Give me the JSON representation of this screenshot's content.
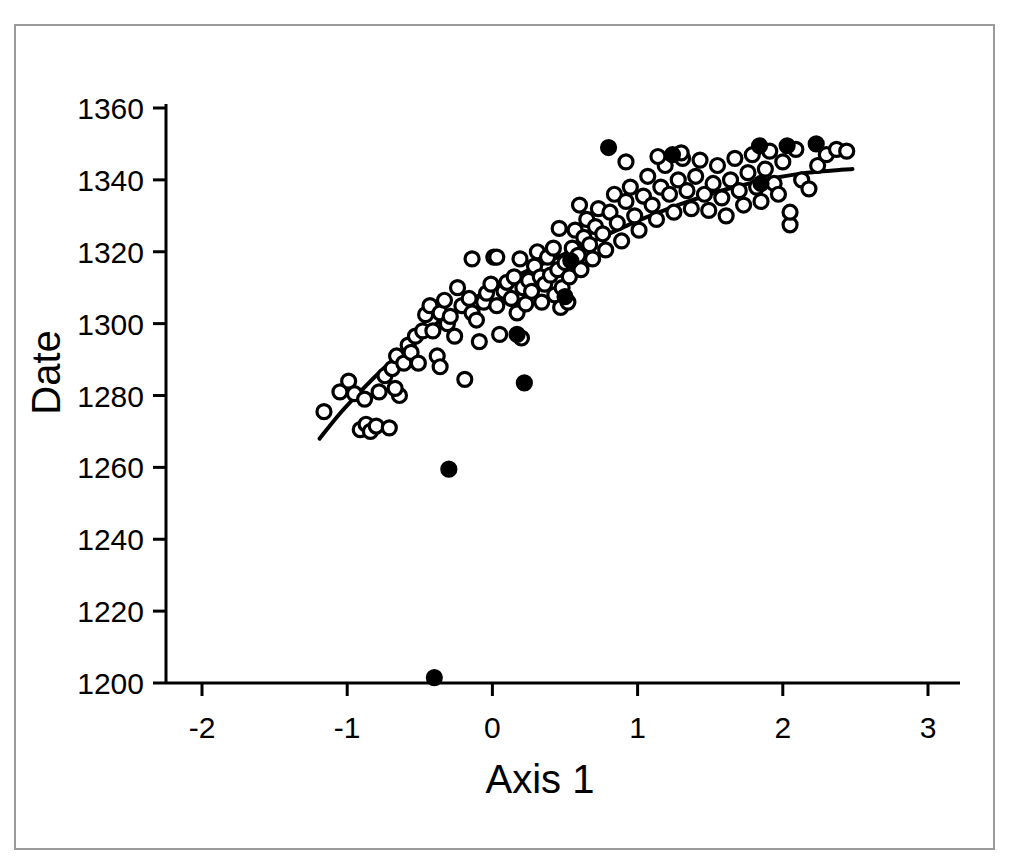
{
  "figure": {
    "background": "#ffffff",
    "frame_color": "#9a9a9a",
    "ink_color": "#000000"
  },
  "labels": {
    "xlabel": "Axis 1",
    "ylabel": "Date"
  },
  "chart_data": {
    "type": "scatter",
    "title": "",
    "xlabel": "Axis 1",
    "ylabel": "Date",
    "xlim": [
      -2.45,
      3.45
    ],
    "ylim": [
      1193,
      1367
    ],
    "xticks": [
      -2,
      -1,
      0,
      1,
      2,
      3
    ],
    "xticklabels": [
      "-2",
      "-1",
      "0",
      "1",
      "2",
      "3"
    ],
    "yticks": [
      1200,
      1220,
      1240,
      1260,
      1280,
      1300,
      1320,
      1340,
      1360
    ],
    "yticklabels": [
      "1200",
      "1220",
      "1240",
      "1260",
      "1280",
      "1300",
      "1320",
      "1340",
      "1360"
    ],
    "grid": false,
    "legend": false,
    "marker_radius_px": 7,
    "series": [
      {
        "name": "open-circles",
        "marker": "open circle",
        "fill": "none",
        "edge": "#000000",
        "points": [
          [
            -1.16,
            1275.5
          ],
          [
            -1.05,
            1281.0
          ],
          [
            -0.99,
            1284.0
          ],
          [
            -0.95,
            1280.5
          ],
          [
            -0.91,
            1270.5
          ],
          [
            -0.87,
            1272.0
          ],
          [
            -0.84,
            1270.0
          ],
          [
            -0.8,
            1271.5
          ],
          [
            -0.78,
            1281.0
          ],
          [
            -0.74,
            1285.5
          ],
          [
            -0.71,
            1271.0
          ],
          [
            -0.69,
            1287.5
          ],
          [
            -0.66,
            1291.0
          ],
          [
            -0.64,
            1280.0
          ],
          [
            -0.61,
            1289.0
          ],
          [
            -0.58,
            1294.0
          ],
          [
            -0.56,
            1292.0
          ],
          [
            -0.53,
            1296.5
          ],
          [
            -0.51,
            1289.0
          ],
          [
            -0.48,
            1298.0
          ],
          [
            -0.46,
            1302.5
          ],
          [
            -0.43,
            1305.0
          ],
          [
            -0.41,
            1298.0
          ],
          [
            -0.38,
            1291.0
          ],
          [
            -0.36,
            1303.0
          ],
          [
            -0.33,
            1306.5
          ],
          [
            -0.31,
            1300.0
          ],
          [
            -0.29,
            1302.0
          ],
          [
            -0.26,
            1296.5
          ],
          [
            -0.24,
            1310.0
          ],
          [
            -0.21,
            1305.0
          ],
          [
            -0.19,
            1284.5
          ],
          [
            -0.16,
            1307.0
          ],
          [
            -0.14,
            1303.0
          ],
          [
            -0.11,
            1301.0
          ],
          [
            -0.09,
            1295.0
          ],
          [
            -0.06,
            1306.0
          ],
          [
            -0.04,
            1308.5
          ],
          [
            -0.01,
            1311.0
          ],
          [
            0.01,
            1318.5
          ],
          [
            0.03,
            1305.0
          ],
          [
            0.05,
            1297.0
          ],
          [
            0.08,
            1309.0
          ],
          [
            0.1,
            1311.5
          ],
          [
            0.13,
            1307.0
          ],
          [
            0.15,
            1313.0
          ],
          [
            0.17,
            1303.0
          ],
          [
            0.19,
            1318.0
          ],
          [
            0.21,
            1310.0
          ],
          [
            0.23,
            1305.5
          ],
          [
            0.25,
            1312.0
          ],
          [
            0.27,
            1309.0
          ],
          [
            0.29,
            1316.0
          ],
          [
            0.31,
            1320.0
          ],
          [
            0.33,
            1313.0
          ],
          [
            0.34,
            1306.0
          ],
          [
            0.36,
            1311.0
          ],
          [
            0.38,
            1318.5
          ],
          [
            0.4,
            1313.5
          ],
          [
            0.42,
            1321.0
          ],
          [
            0.43,
            1308.0
          ],
          [
            0.45,
            1315.0
          ],
          [
            0.47,
            1304.5
          ],
          [
            0.48,
            1310.0
          ],
          [
            0.5,
            1317.0
          ],
          [
            0.52,
            1306.0
          ],
          [
            0.53,
            1313.0
          ],
          [
            0.55,
            1321.0
          ],
          [
            0.57,
            1326.0
          ],
          [
            0.59,
            1319.0
          ],
          [
            0.61,
            1315.0
          ],
          [
            0.63,
            1324.0
          ],
          [
            0.65,
            1329.0
          ],
          [
            0.67,
            1322.0
          ],
          [
            0.69,
            1318.0
          ],
          [
            0.71,
            1327.0
          ],
          [
            0.73,
            1332.0
          ],
          [
            0.76,
            1325.0
          ],
          [
            0.78,
            1320.5
          ],
          [
            0.81,
            1331.0
          ],
          [
            0.84,
            1336.0
          ],
          [
            0.86,
            1328.0
          ],
          [
            0.89,
            1323.0
          ],
          [
            0.92,
            1334.0
          ],
          [
            0.95,
            1338.0
          ],
          [
            0.98,
            1330.0
          ],
          [
            1.01,
            1326.0
          ],
          [
            1.04,
            1335.5
          ],
          [
            1.07,
            1341.0
          ],
          [
            1.1,
            1333.0
          ],
          [
            1.13,
            1329.0
          ],
          [
            1.16,
            1338.0
          ],
          [
            1.19,
            1344.0
          ],
          [
            1.22,
            1336.0
          ],
          [
            1.25,
            1331.0
          ],
          [
            1.28,
            1340.0
          ],
          [
            1.31,
            1346.0
          ],
          [
            1.34,
            1337.0
          ],
          [
            1.37,
            1332.0
          ],
          [
            1.4,
            1341.0
          ],
          [
            1.43,
            1345.5
          ],
          [
            1.46,
            1336.0
          ],
          [
            1.49,
            1331.5
          ],
          [
            1.52,
            1339.0
          ],
          [
            1.55,
            1344.0
          ],
          [
            1.58,
            1335.0
          ],
          [
            1.61,
            1330.0
          ],
          [
            1.64,
            1340.0
          ],
          [
            1.67,
            1346.0
          ],
          [
            1.7,
            1337.0
          ],
          [
            1.73,
            1333.0
          ],
          [
            1.76,
            1342.0
          ],
          [
            1.79,
            1347.0
          ],
          [
            1.82,
            1338.0
          ],
          [
            1.85,
            1334.0
          ],
          [
            1.88,
            1343.0
          ],
          [
            1.91,
            1348.0
          ],
          [
            1.94,
            1339.0
          ],
          [
            1.97,
            1336.0
          ],
          [
            2.0,
            1345.0
          ],
          [
            2.05,
            1327.5
          ],
          [
            2.05,
            1331.0
          ],
          [
            2.09,
            1348.5
          ],
          [
            2.13,
            1340.0
          ],
          [
            2.18,
            1337.5
          ],
          [
            2.24,
            1344.0
          ],
          [
            2.3,
            1347.0
          ],
          [
            2.37,
            1348.5
          ],
          [
            2.44,
            1348.0
          ],
          [
            0.03,
            1318.5
          ],
          [
            -0.14,
            1318.0
          ],
          [
            1.3,
            1347.5
          ],
          [
            0.92,
            1345.0
          ],
          [
            1.14,
            1346.5
          ],
          [
            0.6,
            1333.0
          ],
          [
            0.46,
            1326.5
          ],
          [
            0.2,
            1296.0
          ],
          [
            -0.36,
            1288.0
          ],
          [
            -0.67,
            1282.0
          ],
          [
            -0.88,
            1279.0
          ]
        ]
      },
      {
        "name": "filled-circles",
        "marker": "filled circle",
        "fill": "#000000",
        "edge": "#000000",
        "points": [
          [
            -0.4,
            1201.5
          ],
          [
            -0.3,
            1259.5
          ],
          [
            0.22,
            1283.5
          ],
          [
            0.17,
            1297.0
          ],
          [
            0.5,
            1307.5
          ],
          [
            0.54,
            1317.5
          ],
          [
            0.8,
            1349.0
          ],
          [
            1.24,
            1347.0
          ],
          [
            1.85,
            1339.0
          ],
          [
            2.03,
            1349.5
          ],
          [
            2.23,
            1350.0
          ],
          [
            1.84,
            1349.5
          ]
        ]
      }
    ],
    "fit_curve": {
      "name": "smoothed-trend-line",
      "description": "monotone saturating trend line through point cloud",
      "color": "#000000",
      "width_px": 4,
      "points": [
        [
          -1.19,
          1268.0
        ],
        [
          -1.05,
          1275.0
        ],
        [
          -0.9,
          1281.5
        ],
        [
          -0.75,
          1287.5
        ],
        [
          -0.6,
          1293.0
        ],
        [
          -0.45,
          1298.0
        ],
        [
          -0.3,
          1302.5
        ],
        [
          -0.15,
          1306.5
        ],
        [
          0.0,
          1310.0
        ],
        [
          0.15,
          1313.0
        ],
        [
          0.3,
          1315.8
        ],
        [
          0.45,
          1318.5
        ],
        [
          0.6,
          1321.3
        ],
        [
          0.75,
          1324.0
        ],
        [
          0.9,
          1326.8
        ],
        [
          1.05,
          1329.4
        ],
        [
          1.2,
          1331.8
        ],
        [
          1.35,
          1334.0
        ],
        [
          1.5,
          1336.0
        ],
        [
          1.65,
          1337.8
        ],
        [
          1.8,
          1339.3
        ],
        [
          1.95,
          1340.6
        ],
        [
          2.1,
          1341.6
        ],
        [
          2.25,
          1342.3
        ],
        [
          2.4,
          1342.8
        ],
        [
          2.48,
          1343.0
        ]
      ]
    }
  }
}
